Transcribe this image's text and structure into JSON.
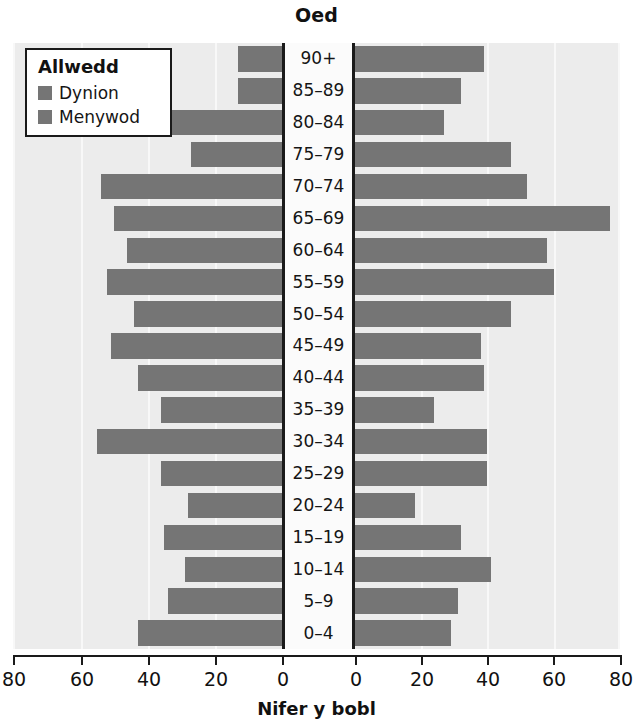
{
  "chart_data": {
    "type": "bar",
    "subtype": "population-pyramid",
    "title": "Oed",
    "xlabel": "Nifer y bobl",
    "ylabel": "Oed",
    "grid": true,
    "legend_position": "top-left",
    "xlim": [
      0,
      80
    ],
    "xticks": [
      80,
      60,
      40,
      20,
      0,
      0,
      20,
      40,
      60,
      80
    ],
    "categories": [
      "90+",
      "85–89",
      "80–84",
      "75–79",
      "70–74",
      "65–69",
      "60–64",
      "55–59",
      "50–54",
      "45–49",
      "40–44",
      "35–39",
      "30–34",
      "25–29",
      "20–24",
      "15–19",
      "10–14",
      "5–9",
      "0–4"
    ],
    "series": [
      {
        "name": "Dynion",
        "side": "left",
        "color": "#757575",
        "values": [
          13,
          13,
          33,
          27,
          54,
          50,
          46,
          52,
          44,
          51,
          43,
          36,
          55,
          36,
          28,
          35,
          29,
          34,
          43
        ]
      },
      {
        "name": "Menywod",
        "side": "right",
        "color": "#757575",
        "values": [
          39,
          32,
          27,
          47,
          52,
          77,
          58,
          60,
          47,
          38,
          39,
          24,
          40,
          40,
          18,
          32,
          41,
          31,
          29
        ]
      }
    ]
  },
  "title": {
    "text": "Oed"
  },
  "legend": {
    "heading": "Allwedd",
    "items": [
      {
        "label": "Dynion",
        "color": "#757575"
      },
      {
        "label": "Menywod",
        "color": "#757575"
      }
    ]
  },
  "axis": {
    "x_title": "Nifer y bobl",
    "tick_labels": [
      "80",
      "60",
      "40",
      "20",
      "0",
      "0",
      "20",
      "40",
      "60",
      "80"
    ]
  },
  "colors": {
    "bar": "#757575",
    "plot_background": "#ececec",
    "gridline": "#f8f8f8",
    "axis": "#1a1a1a",
    "center_band": "#fbfbfb",
    "text": "#111111"
  }
}
